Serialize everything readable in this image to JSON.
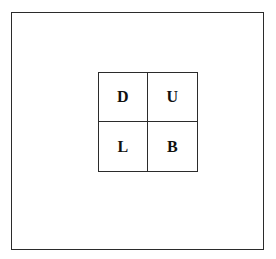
{
  "figure": {
    "type": "diagram",
    "background_color": "#ffffff",
    "line_color": "#2b2b2b",
    "text_color": "#111111"
  },
  "outer_frame": {
    "name": "outer-frame"
  },
  "grid": {
    "rows": 2,
    "columns": 2,
    "cells": [
      {
        "label": "D",
        "row": 0,
        "column": 0,
        "name": "cell-down"
      },
      {
        "label": "U",
        "row": 0,
        "column": 1,
        "name": "cell-up"
      },
      {
        "label": "L",
        "row": 1,
        "column": 0,
        "name": "cell-left"
      },
      {
        "label": "B",
        "row": 1,
        "column": 1,
        "name": "cell-back"
      }
    ]
  }
}
